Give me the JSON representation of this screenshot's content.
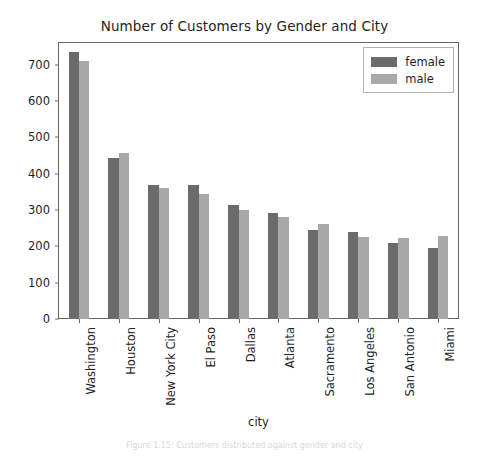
{
  "chart_data": {
    "type": "bar",
    "title": "Number of Customers by Gender and City",
    "xlabel": "city",
    "ylabel": "",
    "categories": [
      "Washington",
      "Houston",
      "New York City",
      "El Paso",
      "Dallas",
      "Atlanta",
      "Sacramento",
      "Los Angeles",
      "San Antonio",
      "Miami"
    ],
    "series": [
      {
        "name": "female",
        "color": "#6b6b6b",
        "values": [
          735,
          444,
          369,
          370,
          313,
          292,
          244,
          240,
          210,
          195
        ]
      },
      {
        "name": "male",
        "color": "#a8a8a8",
        "values": [
          710,
          458,
          361,
          345,
          300,
          280,
          262,
          225,
          222,
          228
        ]
      }
    ],
    "ylim": [
      0,
      760
    ],
    "yticks": [
      0,
      100,
      200,
      300,
      400,
      500,
      600,
      700
    ],
    "ytick_labels": [
      "0",
      "100",
      "200",
      "300",
      "400",
      "500",
      "600",
      "700"
    ],
    "grid": false,
    "legend_position": "upper right"
  },
  "caption": "Figure 1.15: Customers distributed against gender and city"
}
